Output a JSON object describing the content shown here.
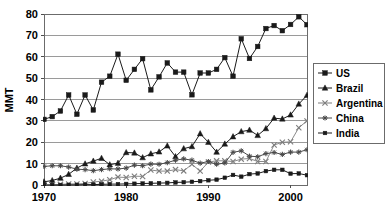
{
  "chart_data": {
    "type": "line",
    "title": "",
    "xlabel": "",
    "ylabel": "MMT",
    "xlim": [
      1970,
      2002
    ],
    "ylim": [
      0,
      80
    ],
    "ytick_step": 10,
    "yticks": [
      0,
      10,
      20,
      30,
      40,
      50,
      60,
      70,
      80
    ],
    "xticks": [
      1970,
      1980,
      1990,
      2000
    ],
    "grid": "horizontal",
    "legend_position": "right",
    "x": [
      1970,
      1971,
      1972,
      1973,
      1974,
      1975,
      1976,
      1977,
      1978,
      1979,
      1980,
      1981,
      1982,
      1983,
      1984,
      1985,
      1986,
      1987,
      1988,
      1989,
      1990,
      1991,
      1992,
      1993,
      1994,
      1995,
      1996,
      1997,
      1998,
      1999,
      2000,
      2001,
      2002
    ],
    "series": [
      {
        "name": "US",
        "marker": "square",
        "color": "#1a1a1a",
        "values": [
          30.7,
          32.0,
          34.6,
          42.1,
          33.1,
          42.1,
          35.1,
          48.1,
          50.9,
          61.2,
          49.0,
          54.1,
          59.1,
          44.5,
          50.6,
          57.1,
          52.8,
          52.8,
          42.2,
          52.4,
          52.4,
          54.1,
          59.6,
          50.9,
          68.4,
          59.2,
          64.8,
          73.2,
          74.6,
          72.2,
          75.1,
          78.7,
          75.0
        ]
      },
      {
        "name": "Brazil",
        "marker": "triangle",
        "color": "#1a1a1a",
        "values": [
          1.5,
          2.1,
          3.2,
          5.0,
          7.9,
          9.9,
          11.2,
          12.5,
          9.5,
          10.2,
          15.2,
          15.0,
          12.8,
          14.6,
          15.5,
          18.3,
          13.3,
          17.0,
          18.0,
          24.0,
          20.0,
          15.4,
          19.2,
          22.6,
          25.0,
          25.7,
          23.2,
          26.4,
          31.3,
          30.9,
          32.8,
          37.9,
          42.0
        ]
      },
      {
        "name": "Argentina",
        "marker": "x",
        "color": "#7d7d7d",
        "values": [
          0.0,
          0.1,
          0.3,
          0.5,
          0.5,
          0.7,
          1.4,
          1.8,
          2.5,
          3.7,
          3.5,
          4.1,
          4.0,
          7.0,
          6.5,
          6.5,
          7.2,
          6.6,
          9.7,
          6.5,
          10.7,
          11.3,
          11.3,
          11.0,
          12.1,
          12.4,
          11.0,
          11.0,
          18.7,
          20.0,
          20.2,
          26.8,
          30.0
        ]
      },
      {
        "name": "China",
        "marker": "asterisk",
        "color": "#4a4a4a",
        "values": [
          8.7,
          9.0,
          9.0,
          8.4,
          7.4,
          7.2,
          6.7,
          7.2,
          7.6,
          7.5,
          7.9,
          9.3,
          9.0,
          9.8,
          9.7,
          10.5,
          11.6,
          12.2,
          11.6,
          10.2,
          11.0,
          9.7,
          10.3,
          15.3,
          16.0,
          13.5,
          13.2,
          14.7,
          15.2,
          14.3,
          15.4,
          15.4,
          16.5
        ]
      },
      {
        "name": "India",
        "marker": "small-square",
        "color": "#1a1a1a",
        "values": [
          0.0,
          0.0,
          0.0,
          0.1,
          0.1,
          0.2,
          0.2,
          0.3,
          0.4,
          0.4,
          0.5,
          0.6,
          0.7,
          0.8,
          0.9,
          1.0,
          1.2,
          1.3,
          1.5,
          1.8,
          2.2,
          2.5,
          3.4,
          4.7,
          3.9,
          5.1,
          5.4,
          6.5,
          7.1,
          7.1,
          5.3,
          5.4,
          4.6
        ]
      }
    ]
  },
  "axis": {
    "y_title": "MMT",
    "y_ticks": [
      "0",
      "10",
      "20",
      "30",
      "40",
      "50",
      "60",
      "70",
      "80"
    ],
    "x_ticks": [
      "1970",
      "1980",
      "1990",
      "2000"
    ]
  },
  "legend": {
    "items": [
      {
        "label": "US",
        "marker": "square"
      },
      {
        "label": "Brazil",
        "marker": "triangle"
      },
      {
        "label": "Argentina",
        "marker": "x"
      },
      {
        "label": "China",
        "marker": "asterisk"
      },
      {
        "label": "India",
        "marker": "small-square"
      }
    ]
  }
}
